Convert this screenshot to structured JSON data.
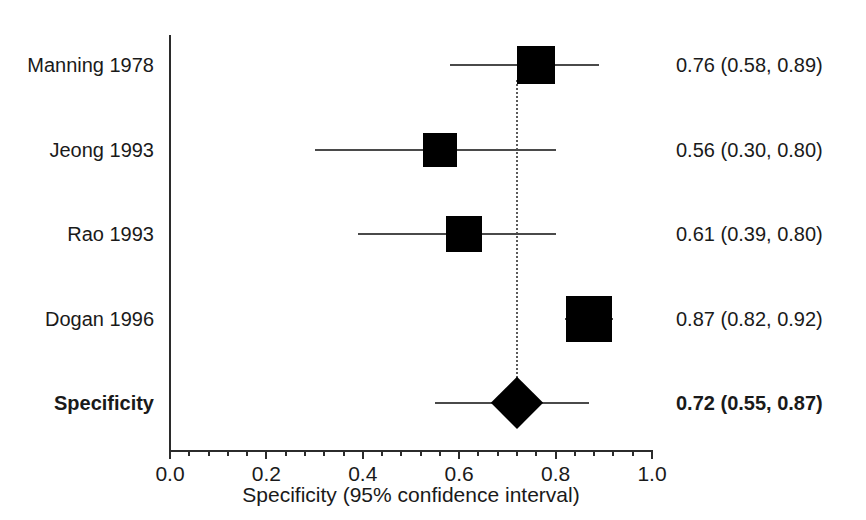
{
  "chart_data": {
    "type": "forest",
    "title": "",
    "xlabel": "Specificity (95% confidence interval)",
    "ylabel": "",
    "xlim": [
      0.0,
      1.0
    ],
    "grid": false,
    "legend": "none",
    "reference_line": 0.72,
    "xticks": [
      {
        "value": 0.0,
        "label": "0.0"
      },
      {
        "value": 0.2,
        "label": "0.2"
      },
      {
        "value": 0.4,
        "label": "0.4"
      },
      {
        "value": 0.6,
        "label": "0.6"
      },
      {
        "value": 0.8,
        "label": "0.8"
      },
      {
        "value": 1.0,
        "label": "1.0"
      }
    ],
    "minor_tick_step": 0.04,
    "rows": [
      {
        "study": "Manning 1978",
        "estimate": 0.76,
        "ci_low": 0.58,
        "ci_high": 0.89,
        "value_label": "0.76 (0.58, 0.89)",
        "marker": "square",
        "weight_size": 38,
        "summary": false
      },
      {
        "study": "Jeong 1993",
        "estimate": 0.56,
        "ci_low": 0.3,
        "ci_high": 0.8,
        "value_label": "0.56 (0.30, 0.80)",
        "marker": "square",
        "weight_size": 34,
        "summary": false
      },
      {
        "study": "Rao 1993",
        "estimate": 0.61,
        "ci_low": 0.39,
        "ci_high": 0.8,
        "value_label": "0.61 (0.39, 0.80)",
        "marker": "square",
        "weight_size": 36,
        "summary": false
      },
      {
        "study": "Dogan 1996",
        "estimate": 0.87,
        "ci_low": 0.82,
        "ci_high": 0.92,
        "value_label": "0.87 (0.82, 0.92)",
        "marker": "square",
        "weight_size": 46,
        "summary": false
      },
      {
        "study": "Specificity",
        "estimate": 0.72,
        "ci_low": 0.55,
        "ci_high": 0.87,
        "value_label": "0.72 (0.55, 0.87)",
        "marker": "diamond",
        "weight_size": 38,
        "summary": true
      }
    ]
  }
}
